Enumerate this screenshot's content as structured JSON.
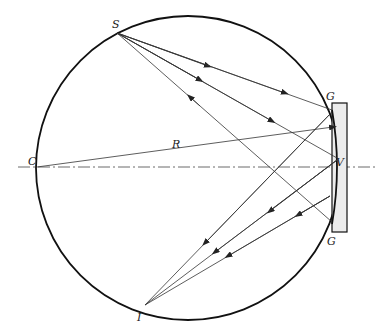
{
  "diagram": {
    "labels": {
      "source": "S",
      "image": "I",
      "center": "C",
      "vertex": "V",
      "grating_top": "G",
      "grating_bottom": "G",
      "radius": "R"
    },
    "geometry": {
      "circle": {
        "cx": 188,
        "cy": 168,
        "r": 152
      },
      "axis_y": 167,
      "points": {
        "S": [
          117,
          33
        ],
        "I": [
          145,
          305
        ],
        "C": [
          37,
          167
        ],
        "V": [
          337,
          158
        ],
        "G_top": [
          332,
          110
        ],
        "G_bottom": [
          332,
          222
        ]
      },
      "grating_rect": {
        "x": 332,
        "y": 103,
        "w": 15,
        "h": 129
      }
    },
    "colors": {
      "line": "#333333",
      "circle": "#111111",
      "grating_fill": "#ececec"
    }
  }
}
